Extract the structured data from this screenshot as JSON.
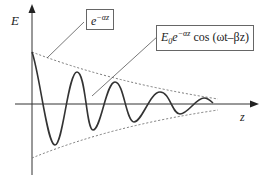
{
  "diagram": {
    "axes": {
      "y_label": "E",
      "x_label": "z"
    },
    "labels": {
      "envelope": {
        "base": "e",
        "exp": "−αz"
      },
      "wave": {
        "base": "E",
        "sub": "0",
        "e": "e",
        "exp": "−αz",
        "tail": " cos (ωt–βz)"
      }
    },
    "colors": {
      "curve": "#333333",
      "axis": "#333333",
      "envelope": "#777777"
    }
  }
}
